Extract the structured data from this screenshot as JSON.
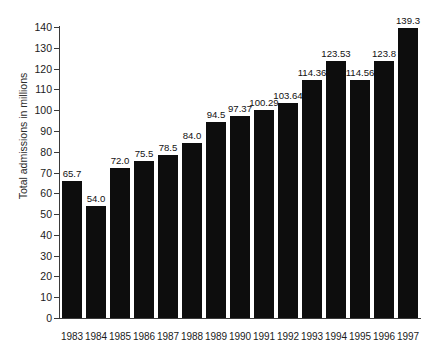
{
  "chart_data": {
    "type": "bar",
    "title": "",
    "subtitle": "",
    "xlabel": "",
    "ylabel": "Total admissions in millions",
    "categories": [
      "1983",
      "1984",
      "1985",
      "1986",
      "1987",
      "1988",
      "1989",
      "1990",
      "1991",
      "1992",
      "1993",
      "1994",
      "1995",
      "1996",
      "1997"
    ],
    "values": [
      65.7,
      54.0,
      72.0,
      75.5,
      78.5,
      84.0,
      94.5,
      97.37,
      100.29,
      103.64,
      114.36,
      123.53,
      114.56,
      123.8,
      139.3
    ],
    "data_labels": [
      "65.7",
      "54.0",
      "72.0",
      "75.5",
      "78.5",
      "84.0",
      "94.5",
      "97.37",
      "100.29",
      "103.64",
      "114.36",
      "123.53",
      "114.56",
      "123.8",
      "139.3"
    ],
    "ylim": [
      0,
      140
    ],
    "ytick_values": [
      0,
      10,
      20,
      30,
      40,
      50,
      60,
      70,
      80,
      90,
      100,
      110,
      120,
      130,
      140
    ],
    "ytick_labels": [
      "0",
      "10",
      "20",
      "30",
      "40",
      "50",
      "60",
      "70",
      "80",
      "90",
      "100",
      "110",
      "120",
      "130",
      "140"
    ],
    "grid": false,
    "legend": false,
    "legend_position": "none",
    "bar_color": "#0d0d0d",
    "axis_color": "#3a3a3a",
    "background_color": "#ffffff"
  }
}
